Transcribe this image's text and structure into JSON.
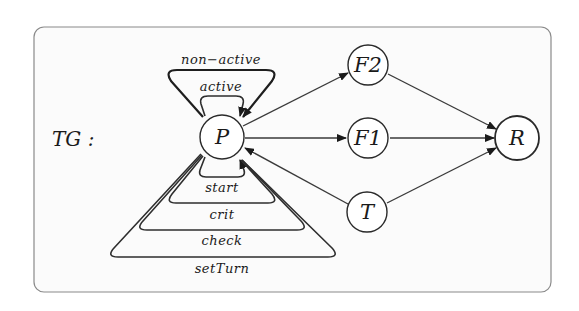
{
  "diagram": {
    "graph_label": "TG :",
    "nodes": [
      {
        "id": "P",
        "label": "P"
      },
      {
        "id": "F2",
        "label": "F2"
      },
      {
        "id": "F1",
        "label": "F1"
      },
      {
        "id": "T",
        "label": "T"
      },
      {
        "id": "R",
        "label": "R"
      }
    ],
    "self_loops": [
      {
        "node": "P",
        "label": "non-active",
        "position": "top"
      },
      {
        "node": "P",
        "label": "active",
        "position": "top"
      },
      {
        "node": "P",
        "label": "start",
        "position": "bottom"
      },
      {
        "node": "P",
        "label": "crit",
        "position": "bottom"
      },
      {
        "node": "P",
        "label": "check",
        "position": "bottom"
      },
      {
        "node": "P",
        "label": "setTurn",
        "position": "bottom"
      }
    ],
    "edges": [
      {
        "from": "P",
        "to": "F2"
      },
      {
        "from": "P",
        "to": "F1"
      },
      {
        "from": "T",
        "to": "P"
      },
      {
        "from": "F2",
        "to": "R"
      },
      {
        "from": "F1",
        "to": "R"
      },
      {
        "from": "T",
        "to": "R"
      }
    ],
    "labels": {
      "non_active": "non−active",
      "active": "active",
      "start": "start",
      "crit": "crit",
      "check": "check",
      "setTurn": "setTurn"
    }
  }
}
